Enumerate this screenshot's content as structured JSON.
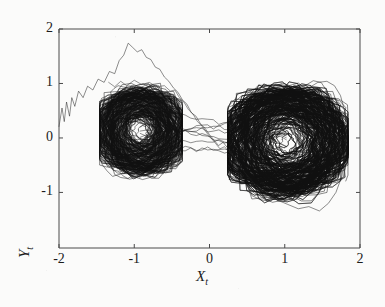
{
  "figure": {
    "background_color": "#fbfbfa",
    "ink_color": "#111111",
    "axis_color": "#4a4a4a"
  },
  "chart_data": {
    "type": "line",
    "title": "",
    "subtitle": "",
    "xlabel": "X_t",
    "ylabel": "Y_t",
    "xlabel_display": "X",
    "xlabel_sub": "t",
    "ylabel_display": "Y",
    "ylabel_sub": "t",
    "xlim": [
      -2,
      2
    ],
    "ylim": [
      -2.02,
      2
    ],
    "xticks": [
      -2,
      -1,
      0,
      1,
      2
    ],
    "xticklabels": [
      "-2",
      "-1",
      "0",
      "1",
      "2"
    ],
    "yticks": [
      -1,
      0,
      1,
      2
    ],
    "yticklabels": [
      "-1",
      "0",
      "1",
      "2"
    ],
    "grid": false,
    "legend": null,
    "series": [
      {
        "name": "trajectory",
        "kind": "phase-orbit",
        "color": "#111111",
        "linewidth": 0.55,
        "lobes": [
          {
            "name": "left-lobe",
            "center_x": -0.92,
            "center_y": 0.13,
            "radius_x": 0.52,
            "radius_y": 0.72,
            "x_range": [
              -1.46,
              -0.36
            ],
            "y_range": [
              -0.92,
              1.06
            ],
            "orbit_count": 210,
            "density": "high"
          },
          {
            "name": "right-lobe",
            "center_x": 1.02,
            "center_y": -0.06,
            "radius_x": 0.72,
            "radius_y": 0.92,
            "x_range": [
              0.24,
              1.84
            ],
            "y_range": [
              -1.36,
              1.08
            ],
            "orbit_count": 320,
            "density": "very-high"
          }
        ],
        "saddle_crossings": {
          "x": 0.05,
          "y_range": [
            -0.35,
            0.45
          ],
          "count": 9
        }
      },
      {
        "name": "transient",
        "kind": "jagged-excursion",
        "color": "#222222",
        "linewidth": 0.55,
        "points": [
          [
            -2.0,
            0.21
          ],
          [
            -1.96,
            0.55
          ],
          [
            -1.93,
            0.3
          ],
          [
            -1.9,
            0.66
          ],
          [
            -1.86,
            0.4
          ],
          [
            -1.83,
            0.74
          ],
          [
            -1.79,
            0.58
          ],
          [
            -1.74,
            0.86
          ],
          [
            -1.68,
            0.74
          ],
          [
            -1.62,
            0.95
          ],
          [
            -1.55,
            0.88
          ],
          [
            -1.48,
            1.08
          ],
          [
            -1.4,
            1.02
          ],
          [
            -1.33,
            1.22
          ],
          [
            -1.26,
            1.18
          ],
          [
            -1.2,
            1.42
          ],
          [
            -1.14,
            1.52
          ],
          [
            -1.08,
            1.74
          ],
          [
            -1.02,
            1.66
          ],
          [
            -0.96,
            1.58
          ],
          [
            -0.9,
            1.62
          ],
          [
            -0.84,
            1.48
          ],
          [
            -0.78,
            1.44
          ],
          [
            -0.72,
            1.3
          ],
          [
            -0.66,
            1.26
          ],
          [
            -0.6,
            1.12
          ],
          [
            -0.54,
            1.04
          ],
          [
            -0.48,
            0.92
          ],
          [
            -0.42,
            0.84
          ],
          [
            -0.36,
            0.7
          ],
          [
            -0.3,
            0.62
          ],
          [
            -0.24,
            0.46
          ],
          [
            -0.18,
            0.4
          ],
          [
            -0.12,
            0.26
          ],
          [
            -0.06,
            0.18
          ],
          [
            0.0,
            0.06
          ],
          [
            0.06,
            -0.04
          ],
          [
            0.12,
            -0.14
          ],
          [
            0.18,
            -0.08
          ],
          [
            0.24,
            -0.18
          ],
          [
            0.3,
            -0.3
          ],
          [
            0.38,
            -0.46
          ],
          [
            0.46,
            -0.62
          ],
          [
            0.56,
            -0.78
          ],
          [
            0.66,
            -0.92
          ],
          [
            0.78,
            -1.04
          ],
          [
            0.9,
            -1.14
          ],
          [
            1.04,
            -1.22
          ],
          [
            1.18,
            -1.3
          ],
          [
            1.32,
            -1.26
          ],
          [
            1.46,
            -1.34
          ],
          [
            1.58,
            -1.2
          ],
          [
            1.68,
            -1.0
          ],
          [
            1.76,
            -0.7
          ],
          [
            1.8,
            -0.3
          ],
          [
            1.82,
            0.1
          ],
          [
            1.8,
            0.48
          ],
          [
            1.74,
            0.78
          ],
          [
            1.66,
            0.96
          ],
          [
            1.56,
            1.04
          ],
          [
            1.44,
            1.02
          ],
          [
            1.32,
            0.92
          ]
        ]
      },
      {
        "name": "secondary-transient",
        "kind": "jagged-excursion",
        "color": "#222222",
        "linewidth": 0.5,
        "points": [
          [
            -1.34,
            1.02
          ],
          [
            -1.26,
            0.94
          ],
          [
            -1.18,
            1.04
          ],
          [
            -1.1,
            0.96
          ],
          [
            -1.0,
            1.06
          ],
          [
            -0.9,
            0.98
          ],
          [
            -0.8,
            1.02
          ],
          [
            -0.7,
            0.94
          ],
          [
            -0.6,
            0.96
          ],
          [
            -0.52,
            0.86
          ],
          [
            -0.46,
            0.88
          ],
          [
            -0.4,
            0.74
          ],
          [
            -0.34,
            0.66
          ],
          [
            -0.28,
            0.52
          ],
          [
            -0.22,
            0.44
          ],
          [
            -0.16,
            0.3
          ],
          [
            -0.1,
            0.22
          ],
          [
            -0.04,
            0.1
          ],
          [
            0.02,
            0.0
          ],
          [
            0.08,
            -0.1
          ],
          [
            0.14,
            -0.2
          ],
          [
            0.2,
            -0.16
          ],
          [
            0.26,
            -0.26
          ],
          [
            0.34,
            -0.36
          ],
          [
            0.42,
            -0.48
          ]
        ]
      }
    ]
  },
  "axes": {
    "frame": {
      "left_px": 59,
      "right_px": 360,
      "top_px": 29,
      "bottom_px": 248
    },
    "tick_length_px": 4
  }
}
